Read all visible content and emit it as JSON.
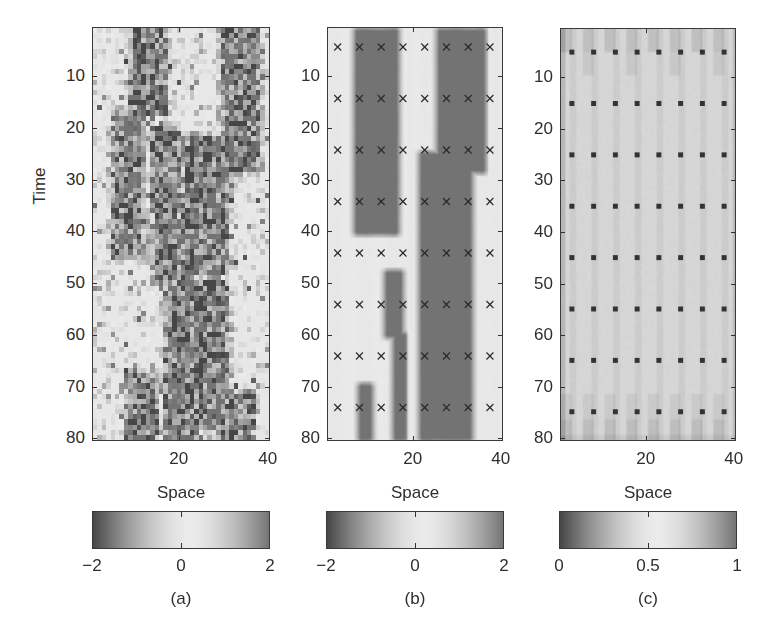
{
  "figure": {
    "ylabel": "Time",
    "xlabel": "Space"
  },
  "panels": [
    {
      "id": "a",
      "caption": "(a)",
      "xlabel": "Space",
      "ylabel": "Time",
      "frame": {
        "x": 92,
        "y": 27,
        "w": 178,
        "h": 414
      },
      "yticks": [
        10,
        20,
        30,
        40,
        50,
        60,
        70,
        80
      ],
      "xticks": [
        20,
        40
      ],
      "colorbar": {
        "x": 92,
        "y": 511,
        "w": 178,
        "h": 38,
        "ticks": [
          "-2",
          "0",
          "2"
        ],
        "min": -2,
        "max": 2
      },
      "markers": "none"
    },
    {
      "id": "b",
      "caption": "(b)",
      "xlabel": "Space",
      "frame": {
        "x": 327,
        "y": 27,
        "w": 176,
        "h": 414
      },
      "yticks": [
        10,
        20,
        30,
        40,
        50,
        60,
        70,
        80
      ],
      "xticks": [
        20,
        40
      ],
      "colorbar": {
        "x": 326,
        "y": 511,
        "w": 178,
        "h": 38,
        "ticks": [
          "-2",
          "0",
          "2"
        ],
        "min": -2,
        "max": 2
      },
      "markers": "cross"
    },
    {
      "id": "c",
      "caption": "(c)",
      "xlabel": "Space",
      "frame": {
        "x": 560,
        "y": 28,
        "w": 176,
        "h": 413
      },
      "yticks": [
        10,
        20,
        30,
        40,
        50,
        60,
        70,
        80
      ],
      "xticks": [
        20,
        40
      ],
      "colorbar": {
        "x": 559,
        "y": 511,
        "w": 178,
        "h": 38,
        "ticks": [
          "0",
          "0.5",
          "1"
        ],
        "min": 0,
        "max": 1
      },
      "markers": "square"
    }
  ],
  "chart_data": [
    {
      "type": "heatmap",
      "title": "(a)",
      "xlabel": "Space",
      "ylabel": "Time",
      "xlim": [
        0.5,
        40.5
      ],
      "ylim": [
        80.5,
        0.5
      ],
      "x_ticks": [
        20,
        40
      ],
      "y_ticks": [
        10,
        20,
        30,
        40,
        50,
        60,
        70,
        80
      ],
      "colorbar": {
        "range": [
          -2,
          2
        ],
        "ticks": [
          -2,
          0,
          2
        ],
        "colormap": "gray-diverging (dark at extremes, light at center)"
      },
      "description": "Noisy 40x80 pixel field; dark bands (values far from 0) meander in time",
      "dark_bands": [
        {
          "t_start": 1,
          "t_end": 17,
          "x_from": 9,
          "x_to": 16
        },
        {
          "t_start": 1,
          "t_end": 28,
          "x_from": 30,
          "x_to": 37
        },
        {
          "t_start": 17,
          "t_end": 45,
          "x_from": 5,
          "x_to": 11
        },
        {
          "t_start": 20,
          "t_end": 50,
          "x_from": 14,
          "x_to": 19
        },
        {
          "t_start": 22,
          "t_end": 48,
          "x_from": 21,
          "x_to": 30
        },
        {
          "t_start": 45,
          "t_end": 80,
          "x_from": 17,
          "x_to": 23
        },
        {
          "t_start": 50,
          "t_end": 78,
          "x_from": 23,
          "x_to": 30
        },
        {
          "t_start": 68,
          "t_end": 80,
          "x_from": 8,
          "x_to": 14
        },
        {
          "t_start": 72,
          "t_end": 80,
          "x_from": 28,
          "x_to": 36
        }
      ]
    },
    {
      "type": "heatmap",
      "title": "(b)",
      "xlabel": "Space",
      "xlim": [
        0.5,
        40.5
      ],
      "ylim": [
        80.5,
        0.5
      ],
      "x_ticks": [
        20,
        40
      ],
      "y_ticks": [
        10,
        20,
        30,
        40,
        50,
        60,
        70,
        80
      ],
      "colorbar": {
        "range": [
          -2,
          2
        ],
        "ticks": [
          -2,
          0,
          2
        ]
      },
      "description": "Smoothed estimate of field with observation locations marked by crosses",
      "dark_bands": [
        {
          "t_start": 1,
          "t_end": 40,
          "x_from": 7,
          "x_to": 16
        },
        {
          "t_start": 1,
          "t_end": 28,
          "x_from": 26,
          "x_to": 36
        },
        {
          "t_start": 25,
          "t_end": 80,
          "x_from": 22,
          "x_to": 33
        },
        {
          "t_start": 48,
          "t_end": 60,
          "x_from": 14,
          "x_to": 17
        },
        {
          "t_start": 60,
          "t_end": 80,
          "x_from": 16,
          "x_to": 18
        },
        {
          "t_start": 70,
          "t_end": 80,
          "x_from": 8,
          "x_to": 10
        }
      ],
      "markers": {
        "symbol": "x",
        "x": [
          2.5,
          7.5,
          12.5,
          17.5,
          22.5,
          27.5,
          32.5,
          37.5
        ],
        "t": [
          4,
          14,
          24,
          34,
          44,
          54,
          64,
          74
        ]
      }
    },
    {
      "type": "heatmap",
      "title": "(c)",
      "xlabel": "Space",
      "xlim": [
        0.5,
        40.5
      ],
      "ylim": [
        80.5,
        0.5
      ],
      "x_ticks": [
        20,
        40
      ],
      "y_ticks": [
        10,
        20,
        30,
        40,
        50,
        60,
        70,
        80
      ],
      "colorbar": {
        "range": [
          0,
          1
        ],
        "ticks": [
          0,
          0.5,
          1
        ]
      },
      "description": "Near-uniform light field (~0.5) with faint vertical striping at sensor columns and darker bands near t<10 and t>70; square markers at observation sites",
      "markers": {
        "symbol": "square",
        "x": [
          3,
          8,
          13,
          18,
          23,
          28,
          33,
          38
        ],
        "t": [
          5,
          15,
          25,
          35,
          45,
          55,
          65,
          75
        ]
      }
    }
  ]
}
